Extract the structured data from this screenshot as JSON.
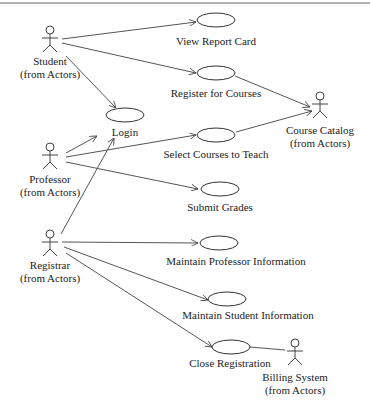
{
  "diagram": {
    "type": "UML use case diagram",
    "actors": [
      {
        "id": "student",
        "name": "Student",
        "stereotype": "(from Actors)"
      },
      {
        "id": "professor",
        "name": "Professor",
        "stereotype": "(from Actors)"
      },
      {
        "id": "registrar",
        "name": "Registrar",
        "stereotype": "(from Actors)"
      },
      {
        "id": "course_catalog",
        "name": "Course Catalog",
        "stereotype": "(from Actors)"
      },
      {
        "id": "billing_system",
        "name": "Billing System",
        "stereotype": "(from Actors)"
      }
    ],
    "use_cases": [
      {
        "id": "view_report_card",
        "label": "View Report Card"
      },
      {
        "id": "register_for_courses",
        "label": "Register for Courses"
      },
      {
        "id": "login",
        "label": "Login"
      },
      {
        "id": "select_courses_to_teach",
        "label": "Select Courses to Teach"
      },
      {
        "id": "submit_grades",
        "label": "Submit Grades"
      },
      {
        "id": "maintain_professor_information",
        "label": "Maintain Professor Information"
      },
      {
        "id": "maintain_student_information",
        "label": "Maintain Student Information"
      },
      {
        "id": "close_registration",
        "label": "Close Registration"
      }
    ],
    "associations": [
      {
        "from": "student",
        "to": "view_report_card",
        "arrow": true
      },
      {
        "from": "student",
        "to": "register_for_courses",
        "arrow": true
      },
      {
        "from": "student",
        "to": "login",
        "arrow": true
      },
      {
        "from": "register_for_courses",
        "to": "course_catalog",
        "arrow": true
      },
      {
        "from": "professor",
        "to": "login",
        "arrow": true
      },
      {
        "from": "professor",
        "to": "select_courses_to_teach",
        "arrow": true
      },
      {
        "from": "professor",
        "to": "submit_grades",
        "arrow": true
      },
      {
        "from": "select_courses_to_teach",
        "to": "course_catalog",
        "arrow": true
      },
      {
        "from": "registrar",
        "to": "login",
        "arrow": true
      },
      {
        "from": "registrar",
        "to": "maintain_professor_information",
        "arrow": true
      },
      {
        "from": "registrar",
        "to": "maintain_student_information",
        "arrow": true
      },
      {
        "from": "registrar",
        "to": "close_registration",
        "arrow": true
      },
      {
        "from": "close_registration",
        "to": "billing_system",
        "arrow": false
      }
    ]
  }
}
